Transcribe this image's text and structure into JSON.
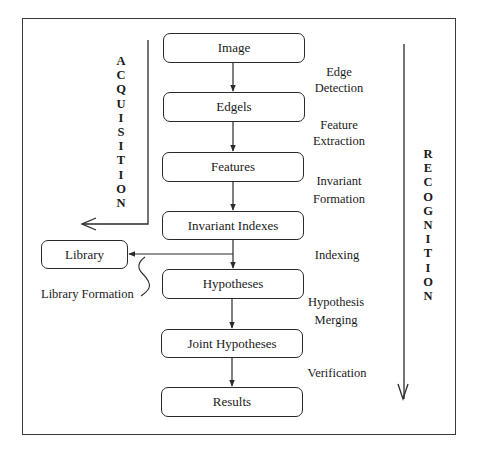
{
  "diagram": {
    "type": "flowchart",
    "pipeline_nodes": [
      {
        "id": "image",
        "label": "Image"
      },
      {
        "id": "edgels",
        "label": "Edgels"
      },
      {
        "id": "features",
        "label": "Features"
      },
      {
        "id": "invariant_indexes",
        "label": "Invariant Indexes"
      },
      {
        "id": "hypotheses",
        "label": "Hypotheses"
      },
      {
        "id": "joint_hypotheses",
        "label": "Joint Hypotheses"
      },
      {
        "id": "results",
        "label": "Results"
      }
    ],
    "side_node": {
      "id": "library",
      "label": "Library"
    },
    "step_labels": [
      {
        "between": [
          "image",
          "edgels"
        ],
        "lines": [
          "Edge",
          "Detection"
        ]
      },
      {
        "between": [
          "edgels",
          "features"
        ],
        "lines": [
          "Feature",
          "Extraction"
        ]
      },
      {
        "between": [
          "features",
          "invariant_indexes"
        ],
        "lines": [
          "Invariant",
          "Formation"
        ]
      },
      {
        "between": [
          "invariant_indexes",
          "hypotheses"
        ],
        "lines": [
          "Indexing"
        ]
      },
      {
        "between": [
          "hypotheses",
          "joint_hypotheses"
        ],
        "lines": [
          "Hypothesis",
          "Merging"
        ]
      },
      {
        "between": [
          "joint_hypotheses",
          "results"
        ],
        "lines": [
          "Verification"
        ]
      }
    ],
    "library_formation_label": "Library Formation",
    "phases": {
      "acquisition": {
        "label": "ACQUISITION",
        "letters": [
          "A",
          "C",
          "Q",
          "U",
          "I",
          "S",
          "I",
          "T",
          "I",
          "O",
          "N"
        ]
      },
      "recognition": {
        "label": "RECOGNITION",
        "letters": [
          "R",
          "E",
          "C",
          "O",
          "G",
          "N",
          "I",
          "T",
          "I",
          "O",
          "N"
        ]
      }
    },
    "edges": [
      {
        "from": "image",
        "to": "edgels"
      },
      {
        "from": "edgels",
        "to": "features"
      },
      {
        "from": "features",
        "to": "invariant_indexes"
      },
      {
        "from": "invariant_indexes",
        "to": "hypotheses"
      },
      {
        "from": "invariant_indexes",
        "to": "library"
      },
      {
        "from": "hypotheses",
        "to": "joint_hypotheses"
      },
      {
        "from": "joint_hypotheses",
        "to": "results"
      }
    ]
  }
}
